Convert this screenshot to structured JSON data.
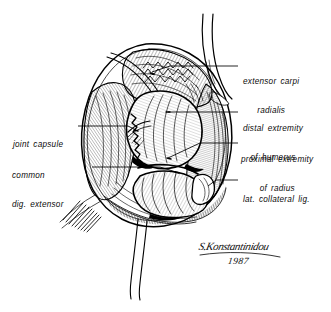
{
  "figure": {
    "kind": "anatomical-line-illustration",
    "technique": "pen-and-ink hatching",
    "ink_color": "#000000",
    "background_color": "#ffffff"
  },
  "labels": {
    "extensor_carpi_radialis": {
      "line1": "extensor carpi",
      "line2": "radialis"
    },
    "distal_extremity_of_humerus": {
      "line1": "distal extremity",
      "line2": "of humerus"
    },
    "proximal_extremity_of_radius": {
      "line1": "proximal extremity",
      "line2": "of radius"
    },
    "lat_collateral_lig": {
      "line1": "lat. collateral lig."
    },
    "joint_capsule": {
      "line1": "joint capsule"
    },
    "common_dig_extensor": {
      "line1": "common",
      "line2": "dig. extensor"
    }
  },
  "signature": {
    "name": "S.Konstantinidou",
    "year": "1987"
  }
}
